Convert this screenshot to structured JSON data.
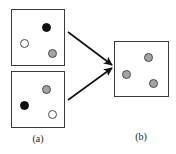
{
  "figure": {
    "width": 176,
    "height": 154,
    "background_color": "#ffffff",
    "panels": [
      {
        "id": "panel-a-top",
        "x": 11,
        "y": 9,
        "width": 54,
        "height": 57,
        "border_color": "#3b3b3b",
        "tokens": [
          {
            "name": "token-black",
            "fill": "black",
            "color": "#101010",
            "cx": 34,
            "cy": 17
          },
          {
            "name": "token-white",
            "fill": "white",
            "color": "#ffffff",
            "cx": 12,
            "cy": 33
          },
          {
            "name": "token-gray",
            "fill": "gray",
            "color": "#a3a3a3",
            "cx": 40,
            "cy": 43
          }
        ]
      },
      {
        "id": "panel-a-bottom",
        "x": 11,
        "y": 71,
        "width": 54,
        "height": 57,
        "border_color": "#3b3b3b",
        "tokens": [
          {
            "name": "token-gray",
            "fill": "gray",
            "color": "#a3a3a3",
            "cx": 34,
            "cy": 17
          },
          {
            "name": "token-black",
            "fill": "black",
            "color": "#101010",
            "cx": 12,
            "cy": 33
          },
          {
            "name": "token-white",
            "fill": "white",
            "color": "#ffffff",
            "cx": 40,
            "cy": 42
          }
        ]
      },
      {
        "id": "panel-b",
        "x": 114,
        "y": 41,
        "width": 55,
        "height": 56,
        "border_color": "#3b3b3b",
        "tokens": [
          {
            "name": "token-gray",
            "fill": "gray",
            "color": "#a3a3a3",
            "cx": 33,
            "cy": 15
          },
          {
            "name": "token-gray",
            "fill": "gray",
            "color": "#a3a3a3",
            "cx": 11,
            "cy": 32
          },
          {
            "name": "token-gray",
            "fill": "gray",
            "color": "#a3a3a3",
            "cx": 38,
            "cy": 41
          }
        ]
      }
    ],
    "arrows": [
      {
        "name": "arrow-top-to-result",
        "x1": 68,
        "y1": 32,
        "x2": 112,
        "y2": 65,
        "color": "#101010"
      },
      {
        "name": "arrow-bottom-to-result",
        "x1": 68,
        "y1": 100,
        "x2": 112,
        "y2": 68,
        "color": "#101010"
      }
    ],
    "captions": [
      {
        "name": "caption-a",
        "text": "(a)",
        "x": 18,
        "y": 133,
        "width": 40
      },
      {
        "name": "caption-b",
        "text": "(b)",
        "x": 121,
        "y": 131,
        "width": 40
      }
    ]
  }
}
